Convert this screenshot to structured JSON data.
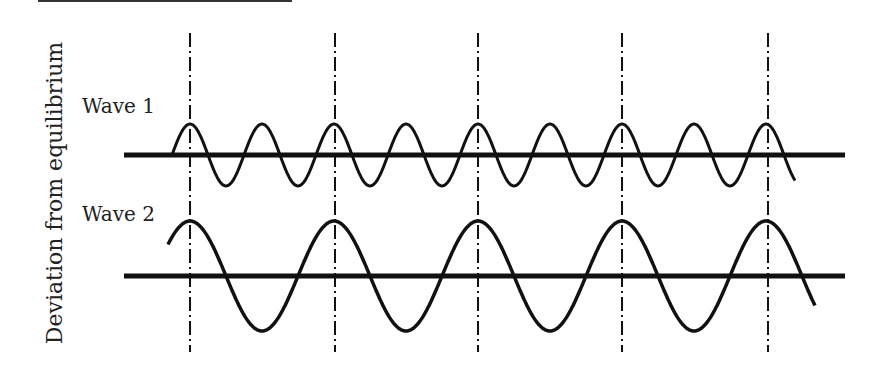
{
  "figure": {
    "y_axis_label": "Deviation from equilibrium",
    "waves": [
      {
        "label": "Wave 1",
        "baseline_y": 155,
        "amplitude": 31,
        "period_px": 72,
        "start_x": 172,
        "end_x": 795
      },
      {
        "label": "Wave 2",
        "baseline_y": 276,
        "amplitude": 55,
        "period_px": 144,
        "start_x": 168,
        "end_x": 815
      }
    ],
    "reference_lines_x": [
      190,
      335,
      478,
      622,
      768
    ],
    "colors": {
      "ink": "#111111",
      "background": "#ffffff"
    }
  }
}
